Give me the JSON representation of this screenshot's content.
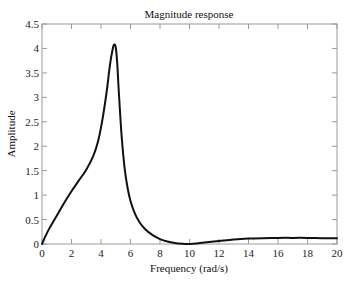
{
  "chart_data": {
    "type": "line",
    "title": "Magnitude response",
    "xlabel": "Frequency (rad/s)",
    "ylabel": "Amplitude",
    "xlim": [
      0,
      20
    ],
    "ylim": [
      0,
      4.5
    ],
    "xticks": [
      "0",
      "2",
      "4",
      "6",
      "8",
      "10",
      "12",
      "14",
      "16",
      "18",
      "20"
    ],
    "yticks": [
      "0",
      "0.5",
      "1",
      "1.5",
      "2",
      "2.5",
      "3",
      "3.5",
      "4",
      "4.5"
    ],
    "grid": false,
    "legend": null,
    "series": [
      {
        "name": "Magnitude",
        "color": "#111111",
        "x": [
          0,
          0.25,
          0.5,
          1,
          1.5,
          2,
          2.5,
          3,
          3.5,
          3.8,
          4.1,
          4.4,
          4.6,
          4.8,
          4.9,
          5.0,
          5.1,
          5.2,
          5.4,
          5.6,
          5.8,
          6.0,
          6.3,
          6.6,
          7.0,
          7.5,
          8.0,
          8.5,
          9.0,
          9.5,
          10.0,
          10.5,
          11,
          12,
          13,
          14,
          15,
          16,
          17,
          18,
          19,
          20
        ],
        "values": [
          0,
          0.17,
          0.32,
          0.58,
          0.84,
          1.08,
          1.3,
          1.52,
          1.82,
          2.1,
          2.55,
          3.15,
          3.65,
          4.0,
          4.08,
          4.02,
          3.7,
          3.15,
          2.2,
          1.55,
          1.15,
          0.88,
          0.62,
          0.45,
          0.3,
          0.18,
          0.1,
          0.05,
          0.02,
          0.005,
          0.0,
          0.01,
          0.03,
          0.06,
          0.09,
          0.11,
          0.12,
          0.125,
          0.125,
          0.125,
          0.12,
          0.12
        ]
      }
    ]
  }
}
